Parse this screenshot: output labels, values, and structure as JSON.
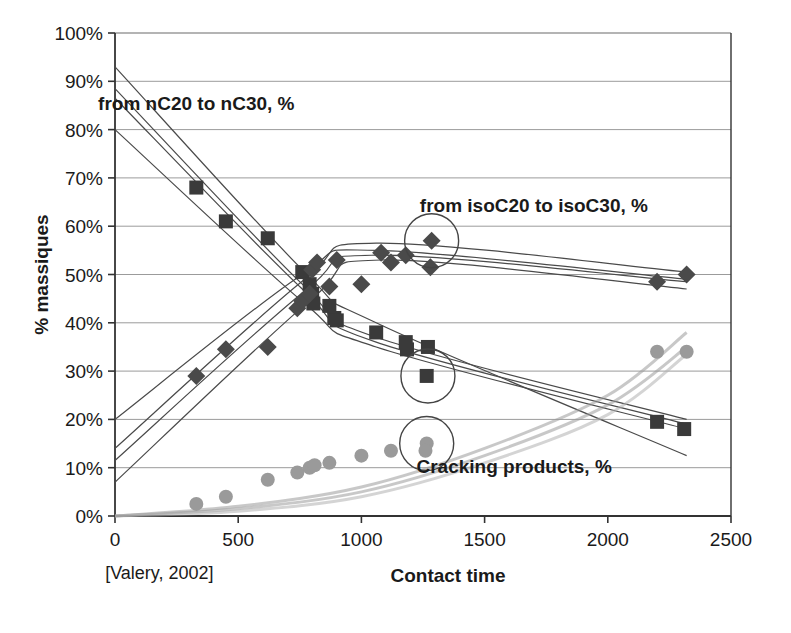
{
  "chart_data": {
    "type": "scatter",
    "title": "",
    "xlabel": "Contact time",
    "ylabel": "% massiques",
    "xlim": [
      0,
      2500
    ],
    "ylim": [
      0,
      1.0
    ],
    "grid": true,
    "legend_position": "in-plot annotations",
    "x_ticks": [
      0,
      500,
      1000,
      1500,
      2000,
      2500
    ],
    "x_tick_labels": [
      "0",
      "500",
      "1000",
      "1500",
      "2000",
      "2500"
    ],
    "y_ticks": [
      0,
      10,
      20,
      30,
      40,
      50,
      60,
      70,
      80,
      90,
      100
    ],
    "y_tick_labels": [
      "0%",
      "10%",
      "20%",
      "30%",
      "40%",
      "50%",
      "60%",
      "70%",
      "80%",
      "90%",
      "100%"
    ],
    "annotations": [
      {
        "text": "from nC20 to nC30, %",
        "x": 330,
        "y": 84
      },
      {
        "text": "from isoC20 to isoC30, %",
        "x": 1700,
        "y": 63
      },
      {
        "text": "Cracking products, %",
        "x": 1620,
        "y": 9
      },
      {
        "text": "[Valery, 2002]",
        "x": 180,
        "y": -13
      }
    ],
    "highlight_circles": [
      {
        "cx": 1285,
        "cy": 57,
        "r_px": 27
      },
      {
        "cx": 1270,
        "cy": 29,
        "r_px": 27
      },
      {
        "cx": 1265,
        "cy": 15,
        "r_px": 27
      }
    ],
    "series": [
      {
        "name": "from nC20 to nC30, %",
        "marker": "square",
        "color": "#3a3a3a",
        "points": [
          {
            "x": 330,
            "y": 68
          },
          {
            "x": 450,
            "y": 61
          },
          {
            "x": 620,
            "y": 57.5
          },
          {
            "x": 760,
            "y": 50.5
          },
          {
            "x": 790,
            "y": 48
          },
          {
            "x": 800,
            "y": 46
          },
          {
            "x": 805,
            "y": 44
          },
          {
            "x": 870,
            "y": 43.5
          },
          {
            "x": 890,
            "y": 41
          },
          {
            "x": 900,
            "y": 40.5
          },
          {
            "x": 1060,
            "y": 38
          },
          {
            "x": 1180,
            "y": 36
          },
          {
            "x": 1185,
            "y": 34.5
          },
          {
            "x": 1270,
            "y": 35
          },
          {
            "x": 1265,
            "y": 29
          },
          {
            "x": 2200,
            "y": 19.5
          },
          {
            "x": 2310,
            "y": 18
          }
        ]
      },
      {
        "name": "from isoC20 to isoC30, %",
        "marker": "diamond",
        "color": "#4a4a4a",
        "points": [
          {
            "x": 330,
            "y": 29
          },
          {
            "x": 450,
            "y": 34.5
          },
          {
            "x": 620,
            "y": 35
          },
          {
            "x": 740,
            "y": 43
          },
          {
            "x": 760,
            "y": 44.5
          },
          {
            "x": 790,
            "y": 46
          },
          {
            "x": 800,
            "y": 51
          },
          {
            "x": 820,
            "y": 52.5
          },
          {
            "x": 870,
            "y": 47.5
          },
          {
            "x": 900,
            "y": 53
          },
          {
            "x": 1000,
            "y": 48
          },
          {
            "x": 1080,
            "y": 54.5
          },
          {
            "x": 1120,
            "y": 52.5
          },
          {
            "x": 1180,
            "y": 54
          },
          {
            "x": 1285,
            "y": 57
          },
          {
            "x": 1280,
            "y": 51.5
          },
          {
            "x": 2200,
            "y": 48.5
          },
          {
            "x": 2320,
            "y": 50
          }
        ]
      },
      {
        "name": "Cracking products, %",
        "marker": "circle",
        "color": "#9a9a9a",
        "points": [
          {
            "x": 330,
            "y": 2.5
          },
          {
            "x": 450,
            "y": 4
          },
          {
            "x": 620,
            "y": 7.5
          },
          {
            "x": 740,
            "y": 9
          },
          {
            "x": 790,
            "y": 10
          },
          {
            "x": 810,
            "y": 10.5
          },
          {
            "x": 870,
            "y": 11
          },
          {
            "x": 1000,
            "y": 12.5
          },
          {
            "x": 1120,
            "y": 13.5
          },
          {
            "x": 1265,
            "y": 15
          },
          {
            "x": 1260,
            "y": 13.5
          },
          {
            "x": 2200,
            "y": 34
          },
          {
            "x": 2320,
            "y": 34
          }
        ]
      }
    ],
    "model_curves": [
      {
        "group": "nC",
        "color": "#4a4a4a",
        "points": [
          [
            0,
            93
          ],
          [
            770,
            50.5
          ],
          [
            1060,
            40
          ],
          [
            2320,
            12.5
          ]
        ]
      },
      {
        "group": "nC",
        "color": "#4a4a4a",
        "points": [
          [
            0,
            88.5
          ],
          [
            760,
            48
          ],
          [
            1060,
            37
          ],
          [
            2320,
            20
          ]
        ]
      },
      {
        "group": "nC",
        "color": "#4a4a4a",
        "points": [
          [
            0,
            86.5
          ],
          [
            760,
            47
          ],
          [
            1060,
            36
          ],
          [
            2320,
            19
          ]
        ]
      },
      {
        "group": "nC",
        "color": "#4a4a4a",
        "points": [
          [
            0,
            80
          ],
          [
            770,
            44
          ],
          [
            1060,
            35
          ],
          [
            2320,
            18
          ]
        ]
      },
      {
        "group": "isoC",
        "color": "#4a4a4a",
        "points": [
          [
            0,
            20
          ],
          [
            760,
            50
          ],
          [
            1060,
            55
          ],
          [
            2320,
            49
          ]
        ]
      },
      {
        "group": "isoC",
        "color": "#4a4a4a",
        "points": [
          [
            0,
            14
          ],
          [
            770,
            49
          ],
          [
            1060,
            56.5
          ],
          [
            2320,
            50.5
          ]
        ]
      },
      {
        "group": "isoC",
        "color": "#4a4a4a",
        "points": [
          [
            0,
            11.5
          ],
          [
            780,
            47
          ],
          [
            1060,
            54
          ],
          [
            2320,
            48.5
          ]
        ]
      },
      {
        "group": "isoC",
        "color": "#4a4a4a",
        "points": [
          [
            0,
            7
          ],
          [
            800,
            45
          ],
          [
            1080,
            53
          ],
          [
            2320,
            47
          ]
        ]
      },
      {
        "group": "cracking",
        "color": "#9a9a9a",
        "points": [
          [
            0,
            0
          ],
          [
            500,
            2
          ],
          [
            1000,
            6
          ],
          [
            1500,
            14
          ],
          [
            2000,
            25
          ],
          [
            2320,
            38
          ]
        ]
      },
      {
        "group": "cracking",
        "color": "#9a9a9a",
        "points": [
          [
            0,
            0
          ],
          [
            500,
            1.5
          ],
          [
            1000,
            5
          ],
          [
            1500,
            12.5
          ],
          [
            2000,
            23
          ],
          [
            2320,
            35
          ]
        ]
      },
      {
        "group": "cracking",
        "color": "#b0b0b0",
        "points": [
          [
            0,
            0
          ],
          [
            500,
            1
          ],
          [
            1000,
            4
          ],
          [
            1500,
            11
          ],
          [
            2000,
            21
          ],
          [
            2320,
            33.5
          ]
        ]
      }
    ]
  }
}
